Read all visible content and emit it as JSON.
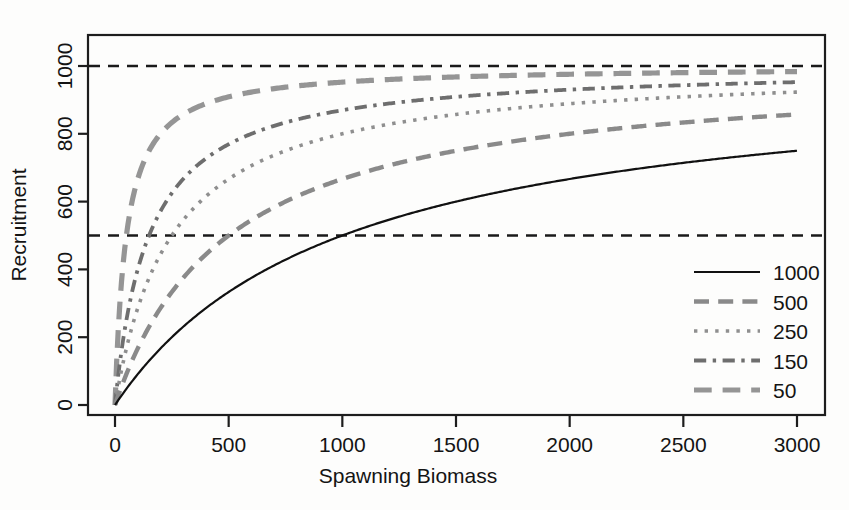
{
  "chart_data": {
    "type": "line",
    "title": "",
    "xlabel": "Spawning Biomass",
    "ylabel": "Recruitment",
    "xlim": [
      0,
      3000
    ],
    "ylim": [
      0,
      1100
    ],
    "xticks": [
      0,
      500,
      1000,
      1500,
      2000,
      2500,
      3000
    ],
    "xtick_labels": [
      "0",
      "500",
      "1000",
      "1500",
      "2000",
      "2500",
      "3000"
    ],
    "yticks": [
      0,
      200,
      400,
      600,
      800,
      1000
    ],
    "ytick_labels": [
      "0",
      "200",
      "400",
      "600",
      "800",
      "1000"
    ],
    "grid": false,
    "legend_position": "right-lower",
    "legend_title": "",
    "reference_lines": [
      {
        "axis": "y",
        "value": 1000,
        "style": "dashed",
        "color": "#1a1a1a"
      },
      {
        "axis": "y",
        "value": 500,
        "style": "dashed",
        "color": "#1a1a1a"
      }
    ],
    "model": "R = 1000 * S / (K + S)",
    "asymptote": 1000,
    "x": [
      0,
      50,
      100,
      150,
      200,
      250,
      300,
      400,
      500,
      600,
      700,
      800,
      900,
      1000,
      1250,
      1500,
      1750,
      2000,
      2250,
      2500,
      2750,
      3000
    ],
    "series": [
      {
        "name": "1000",
        "K": 1000,
        "color": "#111111",
        "dash": "solid",
        "width": 2.2,
        "values": [
          0,
          48,
          91,
          130,
          167,
          200,
          231,
          286,
          333,
          375,
          412,
          444,
          474,
          500,
          556,
          600,
          636,
          667,
          692,
          714,
          733,
          750
        ]
      },
      {
        "name": "500",
        "K": 500,
        "color": "#8a8a8a",
        "dash": "longdash",
        "width": 4.4,
        "values": [
          0,
          91,
          167,
          231,
          286,
          333,
          375,
          444,
          500,
          545,
          583,
          615,
          643,
          667,
          714,
          750,
          778,
          800,
          818,
          833,
          846,
          857
        ]
      },
      {
        "name": "250",
        "K": 250,
        "color": "#8f8f8f",
        "dash": "dotted",
        "width": 3.6,
        "values": [
          0,
          167,
          286,
          375,
          444,
          500,
          545,
          615,
          667,
          706,
          737,
          762,
          783,
          800,
          833,
          857,
          875,
          889,
          900,
          909,
          917,
          923
        ]
      },
      {
        "name": "150",
        "K": 150,
        "color": "#6e6e6e",
        "dash": "dashdot",
        "width": 3.8,
        "values": [
          0,
          250,
          400,
          500,
          571,
          625,
          667,
          727,
          769,
          800,
          824,
          842,
          857,
          870,
          893,
          909,
          921,
          930,
          938,
          943,
          948,
          952
        ]
      },
      {
        "name": "50",
        "K": 50,
        "color": "#959595",
        "dash": "longdash",
        "width": 5.2,
        "values": [
          0,
          500,
          667,
          750,
          800,
          833,
          857,
          889,
          909,
          923,
          933,
          941,
          947,
          952,
          962,
          968,
          972,
          976,
          978,
          980,
          982,
          984
        ]
      }
    ]
  },
  "axes": {
    "x_title": "Spawning Biomass",
    "y_title": "Recruitment"
  },
  "legend": {
    "entries": [
      {
        "label": "1000",
        "swatch": "legend-swatch-1000"
      },
      {
        "label": "500",
        "swatch": "legend-swatch-500"
      },
      {
        "label": "250",
        "swatch": "legend-swatch-250"
      },
      {
        "label": "150",
        "swatch": "legend-swatch-150"
      },
      {
        "label": "50",
        "swatch": "legend-swatch-50"
      }
    ]
  },
  "colors": {
    "axis": "#1d1d1d",
    "background": "#fdfdfc",
    "solid_curve": "#111111",
    "gray_curve": "#8a8a8a"
  }
}
